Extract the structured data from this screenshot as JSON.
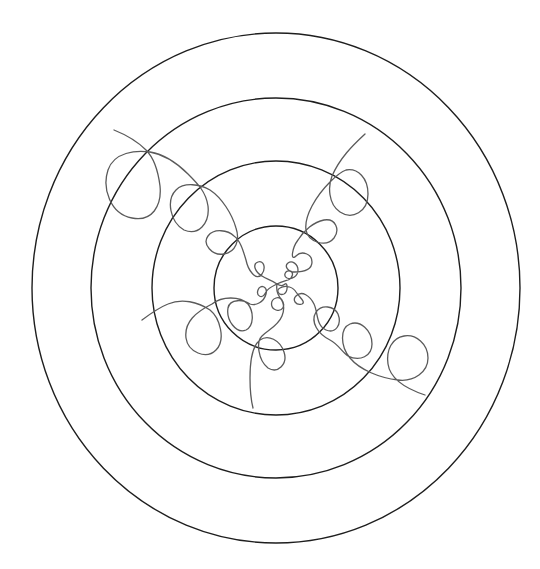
{
  "diagram": {
    "type": "concentric-rings-with-looping-trochoid-arms",
    "canvas": {
      "width": 540,
      "height": 569,
      "background": "#ffffff"
    },
    "center": {
      "x": 276,
      "y": 288
    },
    "colors": {
      "ring_stroke": "#1e1e1e",
      "curve_stroke": "#5a5a5a"
    },
    "rings": [
      {
        "name": "outer-ring",
        "rx": 244,
        "ry": 255
      },
      {
        "name": "ring-2",
        "rx": 185,
        "ry": 190
      },
      {
        "name": "ring-3",
        "rx": 124,
        "ry": 127
      },
      {
        "name": "inner-ring",
        "rx": 62,
        "ry": 62
      }
    ],
    "arms": [
      {
        "name": "arm-upper-left",
        "direction": "upper-left",
        "loop_centers": [
          [
            259,
            271
          ],
          [
            222,
            240
          ],
          [
            188,
            208
          ],
          [
            132,
            182
          ]
        ],
        "tail_end": [
          114,
          130
        ]
      },
      {
        "name": "arm-upper-right",
        "direction": "upper-right",
        "loop_centers": [
          [
            289,
            277
          ],
          [
            294,
            266
          ],
          [
            302,
            265
          ],
          [
            322,
            232
          ],
          [
            349,
            193
          ]
        ],
        "tail_end": [
          365,
          134
        ]
      },
      {
        "name": "arm-lower-left",
        "direction": "lower-left",
        "loop_centers": [
          [
            263,
            290
          ],
          [
            240,
            314
          ],
          [
            202,
            333
          ]
        ],
        "tail_end": [
          142,
          320
        ]
      },
      {
        "name": "arm-lower-right",
        "direction": "lower-right",
        "loop_centers": [
          [
            281,
            289
          ],
          [
            298,
            297
          ],
          [
            326,
            319
          ],
          [
            356,
            340
          ],
          [
            408,
            357
          ]
        ],
        "tail_end": [
          425,
          395
        ]
      },
      {
        "name": "arm-down",
        "direction": "down",
        "loop_centers": [
          [
            276,
            305
          ],
          [
            272,
            355
          ]
        ],
        "tail_end": [
          253,
          408
        ]
      }
    ]
  }
}
